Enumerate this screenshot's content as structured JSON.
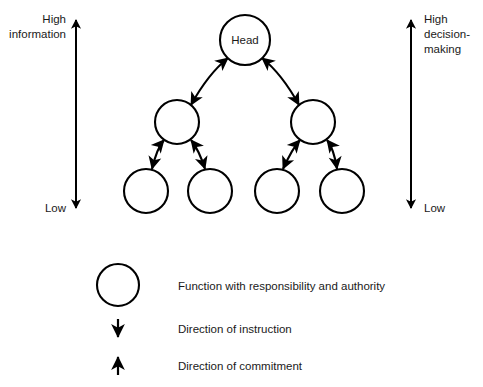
{
  "diagram": {
    "colors": {
      "stroke": "#000000",
      "background": "#ffffff",
      "text": "#1a1a1a"
    },
    "left_axis": {
      "name": "information-axis",
      "top_label_line1": "High",
      "top_label_line2": "information",
      "bottom_label": "Low",
      "direction": "double"
    },
    "right_axis": {
      "name": "decision-making-axis",
      "top_label_line1": "High",
      "top_label_line2": "decision-",
      "top_label_line3": "making",
      "bottom_label": "Low",
      "direction": "double"
    },
    "nodes": [
      {
        "id": "head",
        "label": "Head",
        "level": 0,
        "cx": 245,
        "cy": 40,
        "r": 25
      },
      {
        "id": "mid-left",
        "label": "",
        "level": 1,
        "cx": 177,
        "cy": 122,
        "r": 22
      },
      {
        "id": "mid-right",
        "label": "",
        "level": 1,
        "cx": 313,
        "cy": 122,
        "r": 22
      },
      {
        "id": "leaf-1",
        "label": "",
        "level": 2,
        "cx": 146,
        "cy": 191,
        "r": 22
      },
      {
        "id": "leaf-2",
        "label": "",
        "level": 2,
        "cx": 210,
        "cy": 191,
        "r": 22
      },
      {
        "id": "leaf-3",
        "label": "",
        "level": 2,
        "cx": 277,
        "cy": 191,
        "r": 22
      },
      {
        "id": "leaf-4",
        "label": "",
        "level": 2,
        "cx": 342,
        "cy": 191,
        "r": 22
      }
    ],
    "links": [
      {
        "from": "head",
        "to": "mid-left",
        "arrows": "both"
      },
      {
        "from": "head",
        "to": "mid-right",
        "arrows": "both"
      },
      {
        "from": "mid-left",
        "to": "leaf-1",
        "arrows": "both"
      },
      {
        "from": "mid-left",
        "to": "leaf-2",
        "arrows": "both"
      },
      {
        "from": "mid-right",
        "to": "leaf-3",
        "arrows": "both"
      },
      {
        "from": "mid-right",
        "to": "leaf-4",
        "arrows": "both"
      }
    ],
    "legend": {
      "items": [
        {
          "symbol": "circle-icon",
          "label": "Function with responsibility and authority"
        },
        {
          "symbol": "arrow-down-icon",
          "label": "Direction of instruction"
        },
        {
          "symbol": "arrow-up-icon",
          "label": "Direction of commitment"
        }
      ]
    }
  }
}
